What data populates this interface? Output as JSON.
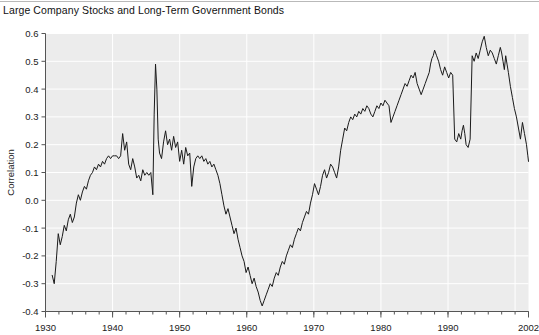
{
  "title": "Large Company Stocks and Long-Term Government Bonds",
  "axis": {
    "ylabel": "Correlation",
    "ytick_labels": [
      "0.6",
      "0.5",
      "0.4",
      "0.3",
      "0.2",
      "0.1",
      "0.0",
      "-0.1",
      "-0.2",
      "-0.3",
      "-0.4"
    ],
    "xtick_labels": [
      "1930",
      "1940",
      "1950",
      "1960",
      "1970",
      "1980",
      "1990",
      "2002"
    ]
  },
  "colors": {
    "plot_background": "#ececec",
    "gridline": "#ffffff",
    "line": "#1a1a1a",
    "axis": "#555555",
    "page_background": "#ffffff"
  },
  "chart_data": {
    "type": "line",
    "title": "Large Company Stocks and Long-Term Government Bonds",
    "xlabel": "",
    "ylabel": "Correlation",
    "xlim": [
      1930,
      2002
    ],
    "ylim": [
      -0.4,
      0.6
    ],
    "yticks": [
      -0.4,
      -0.3,
      -0.2,
      -0.1,
      0.0,
      0.1,
      0.2,
      0.3,
      0.4,
      0.5,
      0.6
    ],
    "xticks": [
      1930,
      1940,
      1950,
      1960,
      1970,
      1980,
      1990,
      2002
    ],
    "minor_xtick_interval": 2,
    "grid": true,
    "legend": "none",
    "series": [
      {
        "name": "Correlation",
        "x": [
          1931.0,
          1931.3,
          1931.6,
          1931.9,
          1932.2,
          1932.5,
          1932.8,
          1933.1,
          1933.4,
          1933.7,
          1934.0,
          1934.3,
          1934.6,
          1934.9,
          1935.2,
          1935.5,
          1935.8,
          1936.1,
          1936.4,
          1936.7,
          1937.0,
          1937.3,
          1937.6,
          1937.9,
          1938.2,
          1938.5,
          1938.8,
          1939.1,
          1939.4,
          1939.7,
          1940.0,
          1940.3,
          1940.6,
          1940.9,
          1941.2,
          1941.5,
          1941.8,
          1942.1,
          1942.4,
          1942.7,
          1943.0,
          1943.3,
          1943.6,
          1943.9,
          1944.2,
          1944.5,
          1944.8,
          1945.1,
          1945.4,
          1945.7,
          1946.0,
          1946.2,
          1946.4,
          1946.6,
          1946.8,
          1947.0,
          1947.3,
          1947.6,
          1947.9,
          1948.2,
          1948.5,
          1948.8,
          1949.1,
          1949.4,
          1949.7,
          1950.0,
          1950.3,
          1950.6,
          1950.9,
          1951.2,
          1951.5,
          1951.8,
          1952.1,
          1952.4,
          1952.7,
          1953.0,
          1953.3,
          1953.6,
          1953.9,
          1954.2,
          1954.5,
          1954.8,
          1955.1,
          1955.4,
          1955.7,
          1956.0,
          1956.3,
          1956.6,
          1956.9,
          1957.2,
          1957.5,
          1957.8,
          1958.1,
          1958.4,
          1958.7,
          1959.0,
          1959.3,
          1959.6,
          1959.9,
          1960.2,
          1960.5,
          1960.8,
          1961.1,
          1961.4,
          1961.7,
          1962.0,
          1962.3,
          1962.6,
          1962.9,
          1963.2,
          1963.5,
          1963.8,
          1964.1,
          1964.4,
          1964.7,
          1965.0,
          1965.3,
          1965.6,
          1965.9,
          1966.2,
          1966.5,
          1966.8,
          1967.1,
          1967.4,
          1967.7,
          1968.0,
          1968.3,
          1968.6,
          1968.9,
          1969.2,
          1969.5,
          1969.8,
          1970.1,
          1970.4,
          1970.7,
          1971.0,
          1971.3,
          1971.6,
          1971.9,
          1972.2,
          1972.5,
          1972.8,
          1973.1,
          1973.4,
          1973.7,
          1974.0,
          1974.3,
          1974.6,
          1974.9,
          1975.2,
          1975.5,
          1975.8,
          1976.1,
          1976.4,
          1976.7,
          1977.0,
          1977.3,
          1977.6,
          1977.9,
          1978.2,
          1978.5,
          1978.8,
          1979.1,
          1979.4,
          1979.7,
          1980.0,
          1980.3,
          1980.6,
          1980.9,
          1981.2,
          1981.5,
          1981.8,
          1982.1,
          1982.4,
          1982.7,
          1983.0,
          1983.3,
          1983.6,
          1983.9,
          1984.2,
          1984.5,
          1984.8,
          1985.1,
          1985.4,
          1985.7,
          1986.0,
          1986.3,
          1986.6,
          1986.9,
          1987.2,
          1987.4,
          1987.6,
          1987.8,
          1988.0,
          1988.3,
          1988.6,
          1988.9,
          1989.2,
          1989.5,
          1989.8,
          1990.1,
          1990.4,
          1990.7,
          1991.0,
          1991.3,
          1991.6,
          1991.9,
          1992.1,
          1992.3,
          1992.5,
          1992.7,
          1993.0,
          1993.3,
          1993.6,
          1993.9,
          1994.2,
          1994.5,
          1994.8,
          1995.1,
          1995.4,
          1995.7,
          1996.0,
          1996.3,
          1996.6,
          1996.9,
          1997.2,
          1997.5,
          1997.8,
          1998.0,
          1998.2,
          1998.4,
          1998.6,
          1998.8,
          1999.0,
          1999.3,
          1999.6,
          1999.9,
          2000.2,
          2000.5,
          2000.8,
          2001.1,
          2001.4,
          2001.7,
          2001.9,
          2002.0
        ],
        "y": [
          -0.27,
          -0.3,
          -0.22,
          -0.12,
          -0.16,
          -0.13,
          -0.09,
          -0.11,
          -0.07,
          -0.05,
          -0.08,
          -0.06,
          -0.01,
          0.02,
          0.0,
          0.03,
          0.05,
          0.04,
          0.07,
          0.09,
          0.1,
          0.12,
          0.11,
          0.13,
          0.12,
          0.14,
          0.13,
          0.15,
          0.16,
          0.15,
          0.16,
          0.16,
          0.16,
          0.15,
          0.16,
          0.24,
          0.18,
          0.21,
          0.13,
          0.11,
          0.15,
          0.12,
          0.08,
          0.09,
          0.07,
          0.11,
          0.09,
          0.1,
          0.09,
          0.1,
          0.02,
          0.31,
          0.49,
          0.4,
          0.22,
          0.17,
          0.15,
          0.21,
          0.25,
          0.2,
          0.22,
          0.18,
          0.23,
          0.19,
          0.21,
          0.14,
          0.18,
          0.13,
          0.19,
          0.16,
          0.17,
          0.05,
          0.12,
          0.15,
          0.16,
          0.15,
          0.16,
          0.14,
          0.15,
          0.13,
          0.14,
          0.12,
          0.13,
          0.11,
          0.09,
          0.06,
          0.02,
          -0.02,
          -0.05,
          -0.03,
          -0.06,
          -0.09,
          -0.12,
          -0.1,
          -0.14,
          -0.17,
          -0.2,
          -0.22,
          -0.26,
          -0.24,
          -0.27,
          -0.3,
          -0.28,
          -0.31,
          -0.33,
          -0.36,
          -0.38,
          -0.36,
          -0.34,
          -0.32,
          -0.3,
          -0.31,
          -0.28,
          -0.26,
          -0.27,
          -0.24,
          -0.22,
          -0.23,
          -0.2,
          -0.18,
          -0.16,
          -0.17,
          -0.14,
          -0.12,
          -0.1,
          -0.11,
          -0.08,
          -0.06,
          -0.04,
          -0.05,
          -0.01,
          0.02,
          0.06,
          0.04,
          0.02,
          0.05,
          0.09,
          0.11,
          0.08,
          0.1,
          0.13,
          0.12,
          0.1,
          0.08,
          0.12,
          0.18,
          0.22,
          0.26,
          0.25,
          0.28,
          0.3,
          0.29,
          0.31,
          0.3,
          0.32,
          0.31,
          0.33,
          0.32,
          0.34,
          0.33,
          0.31,
          0.3,
          0.32,
          0.34,
          0.33,
          0.35,
          0.34,
          0.36,
          0.35,
          0.34,
          0.28,
          0.3,
          0.32,
          0.34,
          0.36,
          0.38,
          0.4,
          0.42,
          0.41,
          0.43,
          0.45,
          0.44,
          0.46,
          0.42,
          0.4,
          0.38,
          0.4,
          0.42,
          0.44,
          0.46,
          0.49,
          0.51,
          0.52,
          0.54,
          0.52,
          0.5,
          0.47,
          0.45,
          0.48,
          0.46,
          0.44,
          0.46,
          0.45,
          0.22,
          0.21,
          0.24,
          0.22,
          0.25,
          0.27,
          0.24,
          0.2,
          0.19,
          0.22,
          0.52,
          0.5,
          0.53,
          0.51,
          0.54,
          0.57,
          0.59,
          0.55,
          0.52,
          0.54,
          0.53,
          0.51,
          0.49,
          0.52,
          0.55,
          0.53,
          0.5,
          0.47,
          0.52,
          0.49,
          0.46,
          0.41,
          0.37,
          0.33,
          0.3,
          0.26,
          0.22,
          0.28,
          0.24,
          0.2,
          0.16,
          0.14
        ]
      }
    ],
    "annotations": [
      "Sharp positive spike near 1946 reaching approximately 0.49",
      "Deep trough near 1960-1962 reaching approximately -0.38",
      "Peak near 1994-1995 reaching approximately 0.59",
      "Steep decline after 1998 ending near -0.29 at 2002"
    ]
  }
}
